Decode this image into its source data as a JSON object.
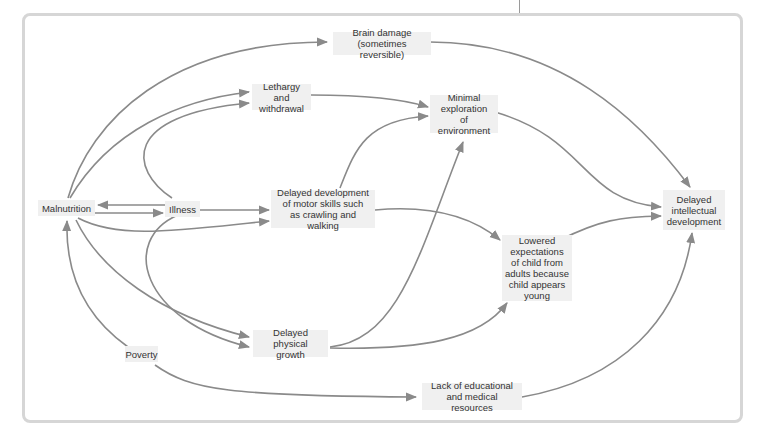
{
  "diagram": {
    "colors": {
      "arrow": "#8a8a8a",
      "node_bg": "#f0f0f0",
      "frame": "#d6d6d6",
      "text": "#333333"
    },
    "nodes": {
      "malnutrition": "Malnutrition",
      "illness": "Illness",
      "poverty": "Poverty",
      "brain_damage": [
        "Brain damage",
        "(sometimes reversible)"
      ],
      "lethargy": [
        "Lethargy and",
        "withdrawal"
      ],
      "minimal_exploration": [
        "Minimal",
        "exploration",
        "of environment"
      ],
      "motor_skills": [
        "Delayed development",
        "of motor skills such",
        "as crawling and walking"
      ],
      "physical_growth": [
        "Delayed physical",
        "growth"
      ],
      "lowered_expectations": [
        "Lowered",
        "expectations",
        "of child from",
        "adults because",
        "child appears",
        "young"
      ],
      "intellectual": [
        "Delayed",
        "intellectual",
        "development"
      ],
      "lack_resources": [
        "Lack of educational",
        "and medical resources"
      ]
    },
    "edges": [
      [
        "Malnutrition",
        "Brain damage"
      ],
      [
        "Malnutrition",
        "Lethargy and withdrawal"
      ],
      [
        "Illness",
        "Lethargy and withdrawal"
      ],
      [
        "Illness",
        "Malnutrition"
      ],
      [
        "Malnutrition",
        "Illness"
      ],
      [
        "Illness",
        "Delayed development of motor skills"
      ],
      [
        "Malnutrition",
        "Delayed development of motor skills"
      ],
      [
        "Malnutrition",
        "Delayed physical growth"
      ],
      [
        "Illness",
        "Delayed physical growth"
      ],
      [
        "Poverty",
        "Malnutrition"
      ],
      [
        "Poverty",
        "Lack of educational and medical resources"
      ],
      [
        "Brain damage",
        "Delayed intellectual development"
      ],
      [
        "Lethargy and withdrawal",
        "Minimal exploration of environment"
      ],
      [
        "Delayed development of motor skills",
        "Minimal exploration of environment"
      ],
      [
        "Delayed physical growth",
        "Minimal exploration of environment"
      ],
      [
        "Minimal exploration of environment",
        "Delayed intellectual development"
      ],
      [
        "Delayed development of motor skills",
        "Lowered expectations"
      ],
      [
        "Delayed physical growth",
        "Lowered expectations"
      ],
      [
        "Lowered expectations",
        "Delayed intellectual development"
      ],
      [
        "Lack of educational and medical resources",
        "Delayed intellectual development"
      ]
    ]
  }
}
